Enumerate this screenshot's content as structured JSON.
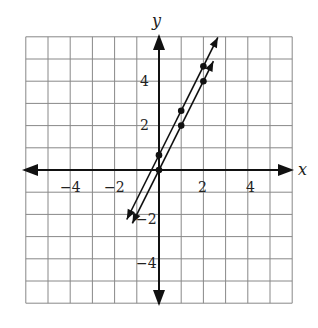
{
  "chart_data": {
    "type": "line",
    "title": "",
    "xlabel": "x",
    "ylabel": "y",
    "xlim": [
      -6,
      6
    ],
    "ylim": [
      -6,
      6
    ],
    "grid": true,
    "x_ticks": [
      -4,
      -2,
      2,
      4
    ],
    "y_ticks": [
      -4,
      -2,
      2,
      4
    ],
    "tick_labels": {
      "x": [
        "−4",
        "−2",
        "2",
        "4"
      ],
      "y": [
        "4",
        "2",
        "−2",
        "−4"
      ]
    },
    "series": [
      {
        "name": "line 1",
        "equation": "y = 2x + 2/3",
        "points": [
          [
            0,
            0.67
          ],
          [
            1,
            2.67
          ],
          [
            2,
            4.67
          ]
        ]
      },
      {
        "name": "line 2",
        "equation": "y = 2x",
        "points": [
          [
            0,
            0
          ],
          [
            1,
            2
          ],
          [
            2,
            4
          ]
        ]
      }
    ]
  },
  "labels": {
    "x": "x",
    "y": "y",
    "xt": [
      "−4",
      "−2",
      "2",
      "4"
    ],
    "yt": [
      "4",
      "2",
      "−2",
      "−4"
    ]
  }
}
